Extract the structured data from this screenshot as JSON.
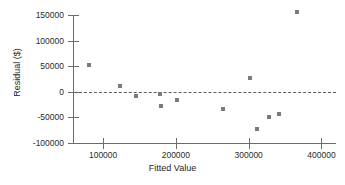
{
  "chart_data": {
    "type": "scatter",
    "title": "",
    "xlabel": "Fitted Value",
    "ylabel": "Residual ($)",
    "xlim": [
      60000,
      420000
    ],
    "ylim": [
      -100000,
      160000
    ],
    "xticks": [
      100000,
      200000,
      300000,
      400000
    ],
    "yticks": [
      150000,
      100000,
      50000,
      0,
      -50000,
      -100000
    ],
    "xtick_labels": [
      "100000",
      "200000",
      "300000",
      "400000"
    ],
    "ytick_labels": [
      "150000",
      "100000",
      "50000",
      "0",
      "-50000",
      "-100000"
    ],
    "grid": false,
    "legend": null,
    "marker_color": "#7a7a7a",
    "axis_color": "#6d6d6d",
    "reference_lines": [
      {
        "name": "zero-residual-line",
        "axis": "y",
        "value": 0,
        "style": "dashed"
      }
    ],
    "points": [
      {
        "x": 81000,
        "y": 53000
      },
      {
        "x": 123000,
        "y": 12000
      },
      {
        "x": 145000,
        "y": -8000
      },
      {
        "x": 178000,
        "y": -4000
      },
      {
        "x": 179000,
        "y": -27000
      },
      {
        "x": 201000,
        "y": -16000
      },
      {
        "x": 265000,
        "y": -33000
      },
      {
        "x": 302000,
        "y": 28000
      },
      {
        "x": 311000,
        "y": -73000
      },
      {
        "x": 328000,
        "y": -49000
      },
      {
        "x": 341000,
        "y": -44000
      },
      {
        "x": 366000,
        "y": 156000
      }
    ]
  }
}
